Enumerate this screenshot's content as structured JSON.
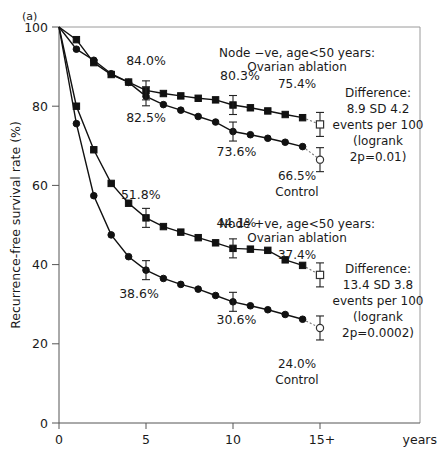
{
  "figure": {
    "panel_label": "(a)",
    "x_units_label": "years"
  },
  "chart_data": {
    "type": "line",
    "title": "",
    "xlabel": "years",
    "ylabel": "Recurrence-free survival rate (%)",
    "xlim": [
      0,
      16.5
    ],
    "ylim": [
      0,
      100
    ],
    "xticks": [
      "0",
      "5",
      "10",
      "15+"
    ],
    "xtick_values": [
      0,
      5,
      10,
      15
    ],
    "yticks": [
      "0",
      "20",
      "40",
      "60",
      "80",
      "100"
    ],
    "ytick_values": [
      0,
      20,
      40,
      60,
      80,
      100
    ],
    "grid": false,
    "legend_position": "inline-annotations",
    "series": [
      {
        "name": "Node -ve, age<50 years: Ovarian ablation",
        "marker": "filled-square",
        "x": [
          0,
          1,
          2,
          3,
          4,
          5,
          6,
          7,
          8,
          9,
          10,
          11,
          12,
          13,
          14
        ],
        "values": [
          100.0,
          96.8,
          91.0,
          88.0,
          86.1,
          84.0,
          83.2,
          82.6,
          82.0,
          81.6,
          80.3,
          79.6,
          78.8,
          77.9,
          77.1
        ],
        "endpoint": {
          "x": 15,
          "value": 75.4,
          "marker": "open-square",
          "error": 4.2
        }
      },
      {
        "name": "Node -ve, age<50 years: Control",
        "marker": "filled-circle",
        "x": [
          0,
          1,
          2,
          3,
          4,
          5,
          6,
          7,
          8,
          9,
          10,
          11,
          12,
          13,
          14
        ],
        "values": [
          100.0,
          94.4,
          91.6,
          88.2,
          86.0,
          82.5,
          80.4,
          79.0,
          77.4,
          76.0,
          73.6,
          72.8,
          71.9,
          70.9,
          69.8
        ],
        "endpoint": {
          "x": 15,
          "value": 66.5,
          "marker": "open-circle",
          "error": 4.0
        }
      },
      {
        "name": "Node +ve, age<50 years: Ovarian ablation",
        "marker": "filled-square",
        "x": [
          0,
          1,
          2,
          3,
          4,
          5,
          6,
          7,
          8,
          9,
          10,
          11,
          12,
          13,
          14
        ],
        "values": [
          100.0,
          80.0,
          69.0,
          60.5,
          55.5,
          51.8,
          49.6,
          48.2,
          46.8,
          45.5,
          44.1,
          43.9,
          43.6,
          41.2,
          39.8
        ],
        "endpoint": {
          "x": 15,
          "value": 37.4,
          "marker": "open-square",
          "error": 3.8
        }
      },
      {
        "name": "Node +ve, age<50 years: Control",
        "marker": "filled-circle",
        "x": [
          0,
          1,
          2,
          3,
          4,
          5,
          6,
          7,
          8,
          9,
          10,
          11,
          12,
          13,
          14
        ],
        "values": [
          100.0,
          75.6,
          57.4,
          47.5,
          42.0,
          38.6,
          36.5,
          35.0,
          33.8,
          32.2,
          30.6,
          29.6,
          28.6,
          27.4,
          26.2
        ],
        "endpoint": {
          "x": 15,
          "value": 24.0,
          "marker": "open-circle",
          "error": 3.6
        }
      }
    ],
    "point_labels": [
      {
        "text": "84.0%",
        "x": 5.0,
        "value": 90.5
      },
      {
        "text": "82.5%",
        "x": 5.0,
        "value": 76.0
      },
      {
        "text": "80.3%",
        "x": 10.4,
        "value": 86.5
      },
      {
        "text": "73.6%",
        "x": 10.2,
        "value": 67.5
      },
      {
        "text": "51.8%",
        "x": 4.7,
        "value": 56.5
      },
      {
        "text": "38.6%",
        "x": 4.6,
        "value": 31.5
      },
      {
        "text": "44.1%",
        "x": 10.2,
        "value": 49.5
      },
      {
        "text": "30.6%",
        "x": 10.2,
        "value": 25.0
      }
    ],
    "annotations": [
      {
        "id": "node-neg-group",
        "lines": [
          "Node −ve, age<50 years:",
          "Ovarian ablation",
          "75.4%"
        ]
      },
      {
        "id": "node-neg-control",
        "lines": [
          "66.5%",
          "Control"
        ]
      },
      {
        "id": "node-neg-difference",
        "lines": [
          "Difference:",
          "8.9 SD 4.2",
          "events per 100",
          "(logrank",
          "2p=0.01)"
        ]
      },
      {
        "id": "node-pos-group",
        "lines": [
          "Node +ve, age<50 years:",
          "Ovarian ablation",
          "37.4%"
        ]
      },
      {
        "id": "node-pos-control",
        "lines": [
          "24.0%",
          "Control"
        ]
      },
      {
        "id": "node-pos-difference",
        "lines": [
          "Difference:",
          "13.4 SD 3.8",
          "events per 100",
          "(logrank",
          "2p=0.0002)"
        ]
      }
    ]
  },
  "colors": {
    "ink": "#111111",
    "axis": "#555555",
    "frame": "#9a9a9a",
    "background": "#ffffff"
  }
}
